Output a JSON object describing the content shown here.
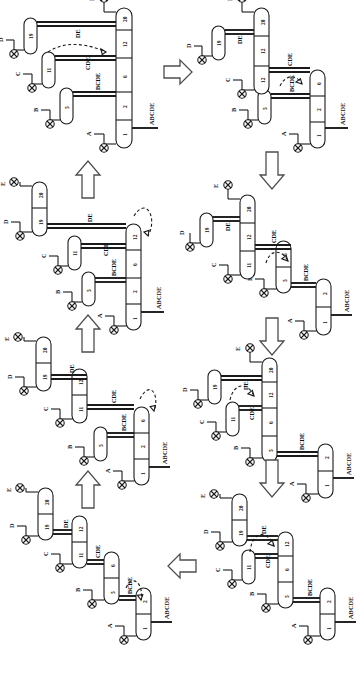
{
  "figure": {
    "orientation": "rotated-90-ccw",
    "background_color": "#ffffff",
    "line_color": "#1a1a1a",
    "arrow_color": "#4d4d4d"
  },
  "labels": {
    "feed": "ABCDE",
    "products": [
      "A",
      "B",
      "C",
      "D",
      "E"
    ],
    "streams": [
      "BCDE",
      "CDE",
      "DE"
    ],
    "trays_main": [
      "1",
      "2",
      "6",
      "12",
      "20"
    ],
    "trays_side": [
      "5",
      "11",
      "19"
    ]
  },
  "panels": [
    {
      "id": "p1",
      "name": "panel-1-fully-thermally-coupled",
      "position": "top-left",
      "feed": "ABCDE",
      "products": [
        "A",
        "B",
        "C",
        "D",
        "E"
      ],
      "stream_labels": [
        "BCDE",
        "CDE",
        "DE"
      ],
      "main_trays": [
        "1",
        "2",
        "6",
        "12",
        "20"
      ],
      "side_columns": [
        {
          "tray": "5",
          "product": "B"
        },
        {
          "tray": "11",
          "product": "C"
        },
        {
          "tray": "19",
          "product": "D"
        }
      ],
      "dashed_links": 1
    },
    {
      "id": "p2",
      "name": "panel-2-split-main-column",
      "position": "top-right",
      "feed": "ABCDE",
      "products": [
        "A",
        "B",
        "C",
        "D",
        "E"
      ],
      "stream_labels": [
        "BCDE",
        "CDE",
        "DE"
      ],
      "main_trays": [
        "1",
        "2",
        "6",
        "11",
        "12",
        "20"
      ],
      "side_columns": [
        {
          "tray": "5",
          "product": "B"
        },
        {
          "tray": "19",
          "product": "D"
        }
      ],
      "dashed_links": 1
    },
    {
      "id": "p3",
      "name": "panel-3-two-section-cascade",
      "position": "middle-right-upper",
      "feed": "ABCDE",
      "products": [
        "A",
        "B",
        "C",
        "D",
        "E"
      ],
      "stream_labels": [
        "BCDE",
        "CDE",
        "DE"
      ],
      "main_trays": [
        "1",
        "2",
        "5",
        "6",
        "11",
        "12",
        "20"
      ],
      "side_columns": [
        {
          "tray": "19",
          "product": "D"
        }
      ],
      "dashed_links": 1
    },
    {
      "id": "p4",
      "name": "panel-4-three-column-cascade",
      "position": "middle-right-lower",
      "feed": "ABCDE",
      "products": [
        "A",
        "B",
        "C",
        "D",
        "E"
      ],
      "stream_labels": [
        "BCDE",
        "CDE",
        "DE"
      ],
      "main_trays": [
        "1",
        "2",
        "5",
        "6",
        "12",
        "20"
      ],
      "side_columns": [
        {
          "tray": "11",
          "product": "C"
        },
        {
          "tray": "19",
          "product": "D"
        }
      ],
      "dashed_links": 1
    },
    {
      "id": "p5",
      "name": "panel-5-four-column-train",
      "position": "bottom-right",
      "feed": "ABCDE",
      "products": [
        "A",
        "B",
        "C",
        "D",
        "E"
      ],
      "stream_labels": [
        "BCDE",
        "CDE",
        "DE"
      ],
      "main_trays": [
        "1",
        "2",
        "5",
        "6",
        "12",
        "19",
        "20"
      ],
      "side_columns": [
        {
          "tray": "11",
          "product": "C"
        }
      ],
      "dashed_links": 1
    },
    {
      "id": "p6",
      "name": "panel-6-direct-sequence",
      "position": "bottom-left",
      "feed": "ABCDE",
      "products": [
        "A",
        "B",
        "C",
        "D",
        "E"
      ],
      "stream_labels": [
        "BCDE",
        "CDE",
        "DE"
      ],
      "main_trays": [
        "1",
        "2",
        "5",
        "6",
        "11",
        "12",
        "19",
        "20"
      ],
      "side_columns": [],
      "dashed_links": 1
    },
    {
      "id": "p7",
      "name": "panel-7-indirect-sequence",
      "position": "middle-left-lower",
      "feed": "ABCDE",
      "products": [
        "A",
        "B",
        "C",
        "D",
        "E"
      ],
      "stream_labels": [
        "BCDE",
        "CDE",
        "DE"
      ],
      "main_trays": [
        "1",
        "2",
        "6",
        "11",
        "12",
        "19",
        "20"
      ],
      "side_columns": [
        {
          "tray": "5",
          "product": "B"
        }
      ],
      "dashed_links": 1
    },
    {
      "id": "p8",
      "name": "panel-8-sloppy-split",
      "position": "middle-left-upper",
      "feed": "ABCDE",
      "products": [
        "A",
        "B",
        "C",
        "D",
        "E"
      ],
      "stream_labels": [
        "BCDE",
        "CDE",
        "DE"
      ],
      "main_trays": [
        "1",
        "2",
        "6",
        "12",
        "19",
        "20"
      ],
      "side_columns": [
        {
          "tray": "5",
          "product": "B"
        },
        {
          "tray": "11",
          "product": "C"
        }
      ],
      "dashed_links": 1
    }
  ],
  "arrows": [
    {
      "name": "arrow-top-right",
      "direction": "right"
    },
    {
      "name": "arrow-right-down-1",
      "direction": "down"
    },
    {
      "name": "arrow-right-down-2",
      "direction": "down"
    },
    {
      "name": "arrow-right-down-3",
      "direction": "down"
    },
    {
      "name": "arrow-bottom-left",
      "direction": "left"
    },
    {
      "name": "arrow-left-up-1",
      "direction": "up"
    },
    {
      "name": "arrow-left-up-2",
      "direction": "up"
    },
    {
      "name": "arrow-left-up-3",
      "direction": "up"
    }
  ]
}
